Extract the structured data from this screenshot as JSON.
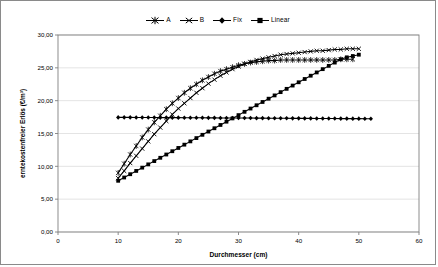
{
  "chart_data": {
    "type": "line",
    "title": "",
    "xlabel": "Durchmesser (cm)",
    "ylabel": "erntekostenfreier Erlös (€/m³)",
    "xlim": [
      0,
      60
    ],
    "ylim": [
      0,
      30
    ],
    "xticks": [
      "0",
      "10",
      "20",
      "30",
      "40",
      "50",
      "60"
    ],
    "xtick_values": [
      0,
      10,
      20,
      30,
      40,
      50,
      60
    ],
    "yticks": [
      "0,00",
      "5,00",
      "10,00",
      "15,00",
      "20,00",
      "25,00",
      "30,00"
    ],
    "ytick_values": [
      0,
      5,
      10,
      15,
      20,
      25,
      30
    ],
    "grid": "horizontal",
    "legend_position": "top-center",
    "series": [
      {
        "name": "A",
        "marker": "star",
        "color": "#000000",
        "x": [
          10,
          11,
          12,
          13,
          14,
          15,
          16,
          17,
          18,
          19,
          20,
          21,
          22,
          23,
          24,
          25,
          26,
          27,
          28,
          29,
          30,
          31,
          32,
          33,
          34,
          35,
          36,
          37,
          38,
          39,
          40,
          41,
          42,
          43,
          44,
          45,
          46,
          47,
          48,
          49
        ],
        "values": [
          9.0,
          10.4,
          11.8,
          13.1,
          14.4,
          15.6,
          16.7,
          17.7,
          18.7,
          19.6,
          20.4,
          21.2,
          21.9,
          22.5,
          23.1,
          23.6,
          24.1,
          24.5,
          24.8,
          25.1,
          25.4,
          25.6,
          25.8,
          25.9,
          26.0,
          26.1,
          26.1,
          26.2,
          26.2,
          26.2,
          26.2,
          26.2,
          26.2,
          26.2,
          26.2,
          26.2,
          26.2,
          26.3,
          26.3,
          26.3
        ]
      },
      {
        "name": "B",
        "marker": "cross",
        "color": "#000000",
        "x": [
          10,
          11,
          12,
          13,
          14,
          15,
          16,
          17,
          18,
          19,
          20,
          21,
          22,
          23,
          24,
          25,
          26,
          27,
          28,
          29,
          30,
          31,
          32,
          33,
          34,
          35,
          36,
          37,
          38,
          39,
          40,
          41,
          42,
          43,
          44,
          45,
          46,
          47,
          48,
          49,
          50
        ],
        "values": [
          8.2,
          9.3,
          10.5,
          11.6,
          12.7,
          13.8,
          14.9,
          15.9,
          16.9,
          17.9,
          18.8,
          19.6,
          20.4,
          21.2,
          21.9,
          22.6,
          23.2,
          23.8,
          24.3,
          24.8,
          25.2,
          25.6,
          25.9,
          26.2,
          26.4,
          26.6,
          26.8,
          27.0,
          27.1,
          27.2,
          27.3,
          27.4,
          27.5,
          27.6,
          27.6,
          27.7,
          27.8,
          27.8,
          27.9,
          27.9,
          27.9
        ]
      },
      {
        "name": "Fix",
        "marker": "diamond",
        "color": "#000000",
        "x": [
          10,
          11,
          12,
          13,
          14,
          15,
          16,
          17,
          18,
          19,
          20,
          21,
          22,
          23,
          24,
          25,
          26,
          27,
          28,
          29,
          30,
          31,
          32,
          33,
          34,
          35,
          36,
          37,
          38,
          39,
          40,
          41,
          42,
          43,
          44,
          45,
          46,
          47,
          48,
          49,
          50,
          51,
          52
        ],
        "values": [
          17.45,
          17.45,
          17.45,
          17.44,
          17.44,
          17.43,
          17.43,
          17.42,
          17.42,
          17.41,
          17.41,
          17.4,
          17.4,
          17.39,
          17.39,
          17.38,
          17.38,
          17.37,
          17.37,
          17.36,
          17.36,
          17.35,
          17.35,
          17.34,
          17.34,
          17.33,
          17.33,
          17.32,
          17.32,
          17.31,
          17.31,
          17.3,
          17.3,
          17.29,
          17.29,
          17.28,
          17.28,
          17.27,
          17.27,
          17.26,
          17.26,
          17.25,
          17.25
        ]
      },
      {
        "name": "Linear",
        "marker": "square",
        "color": "#000000",
        "x": [
          10,
          11,
          12,
          13,
          14,
          15,
          16,
          17,
          18,
          19,
          20,
          21,
          22,
          23,
          24,
          25,
          26,
          27,
          28,
          29,
          30,
          31,
          32,
          33,
          34,
          35,
          36,
          37,
          38,
          39,
          40,
          41,
          42,
          43,
          44,
          45,
          46,
          47,
          48,
          49,
          50
        ],
        "values": [
          7.8,
          8.3,
          8.8,
          9.3,
          9.8,
          10.3,
          10.8,
          11.3,
          11.8,
          12.3,
          12.8,
          13.3,
          13.8,
          14.3,
          14.8,
          15.3,
          15.8,
          16.3,
          16.8,
          17.3,
          17.8,
          18.3,
          18.8,
          19.3,
          19.8,
          20.3,
          20.8,
          21.3,
          21.8,
          22.3,
          22.8,
          23.3,
          23.8,
          24.3,
          24.8,
          25.3,
          25.8,
          26.3,
          26.6,
          26.8,
          27.0
        ]
      }
    ]
  },
  "legend": {
    "items": [
      {
        "label": "A"
      },
      {
        "label": "B"
      },
      {
        "label": "Fix"
      },
      {
        "label": "Linear"
      }
    ]
  },
  "colors": {
    "series": "#000000",
    "axis": "#808080",
    "grid": "#d9d9d9",
    "border": "#8a8a8a",
    "background": "#ffffff"
  }
}
